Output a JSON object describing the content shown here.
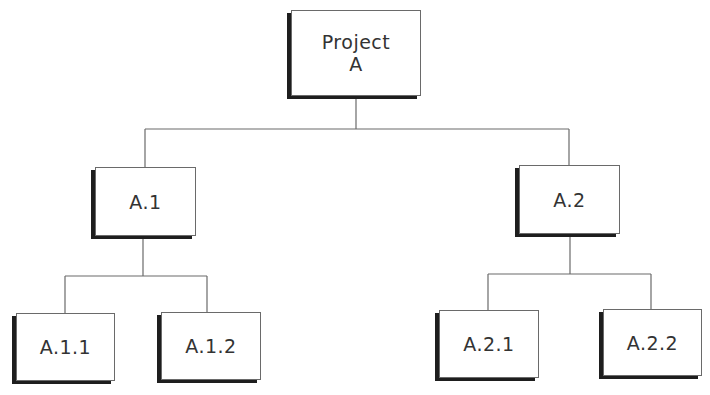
{
  "diagram": {
    "type": "hierarchy-tree",
    "colors": {
      "background": "#ffffff",
      "box_fill": "#ffffff",
      "box_border": "#6a6a6a",
      "box_shadow": "#1e1e1e",
      "connector": "#6a6a6a",
      "text": "#333333"
    },
    "nodes": {
      "root": {
        "label": "Project\nA"
      },
      "a1": {
        "label": "A.1"
      },
      "a2": {
        "label": "A.2"
      },
      "a11": {
        "label": "A.1.1"
      },
      "a12": {
        "label": "A.1.2"
      },
      "a21": {
        "label": "A.2.1"
      },
      "a22": {
        "label": "A.2.2"
      }
    },
    "edges": [
      {
        "from": "Project A",
        "to": "A.1"
      },
      {
        "from": "Project A",
        "to": "A.2"
      },
      {
        "from": "A.1",
        "to": "A.1.1"
      },
      {
        "from": "A.1",
        "to": "A.1.2"
      },
      {
        "from": "A.2",
        "to": "A.2.1"
      },
      {
        "from": "A.2",
        "to": "A.2.2"
      }
    ]
  }
}
